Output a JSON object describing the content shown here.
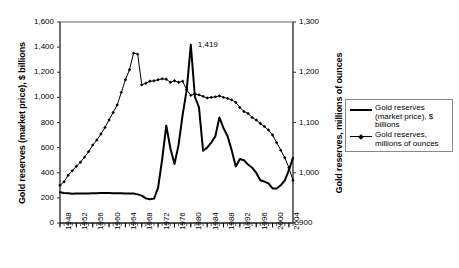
{
  "chart_data": {
    "type": "line",
    "title": "",
    "subtitle": "",
    "xlabel": "",
    "ylabel": "Gold reserves (market price), $ billions",
    "ylabel_secondary": "Gold reserves, millions of ounces",
    "grid": false,
    "legend_position": "right",
    "xlim": [
      1948,
      2005
    ],
    "ylim": [
      0,
      1600
    ],
    "ylim_secondary": [
      900,
      1300
    ],
    "yticks": [
      "0",
      "200",
      "400",
      "600",
      "800",
      "1,000",
      "1,200",
      "1,400",
      "1,600"
    ],
    "ytick_values": [
      0,
      200,
      400,
      600,
      800,
      1000,
      1200,
      1400,
      1600
    ],
    "yticks_secondary": [
      "900",
      "1,000",
      "1,100",
      "1,200",
      "1,300"
    ],
    "ytick_values_secondary": [
      900,
      1000,
      1100,
      1200,
      1300
    ],
    "xticks": [
      "1948",
      "1952",
      "1956",
      "1960",
      "1964",
      "1968",
      "1972",
      "1976",
      "1980",
      "1984",
      "1988",
      "1992",
      "1996",
      "2000",
      "2004"
    ],
    "xtick_values": [
      1948,
      1952,
      1956,
      1960,
      1964,
      1968,
      1972,
      1976,
      1980,
      1984,
      1988,
      1992,
      1996,
      2000,
      2004
    ],
    "annotations": [
      {
        "text": "1,419",
        "x": 1980,
        "y": 1419,
        "axis": "left"
      }
    ],
    "x": [
      1948,
      1949,
      1950,
      1951,
      1952,
      1953,
      1954,
      1955,
      1956,
      1957,
      1958,
      1959,
      1960,
      1961,
      1962,
      1963,
      1964,
      1965,
      1966,
      1967,
      1968,
      1969,
      1970,
      1971,
      1972,
      1973,
      1974,
      1975,
      1976,
      1977,
      1978,
      1979,
      1980,
      1981,
      1982,
      1983,
      1984,
      1985,
      1986,
      1987,
      1988,
      1989,
      1990,
      1991,
      1992,
      1993,
      1994,
      1995,
      1996,
      1997,
      1998,
      1999,
      2000,
      2001,
      2002,
      2003,
      2004,
      2005
    ],
    "series": [
      {
        "name": "Gold reserves (market price), $ billions",
        "axis": "left",
        "unit": "$ billions",
        "marker": "none",
        "linewidth": 2,
        "color": "#000000",
        "values": [
          245,
          238,
          236,
          233,
          234,
          234,
          235,
          235,
          236,
          237,
          238,
          238,
          238,
          237,
          236,
          236,
          235,
          235,
          235,
          228,
          218,
          196,
          189,
          194,
          282,
          508,
          775,
          595,
          470,
          620,
          860,
          1060,
          1419,
          1005,
          920,
          575,
          600,
          640,
          690,
          840,
          755,
          690,
          580,
          450,
          510,
          500,
          465,
          440,
          400,
          340,
          330,
          315,
          275,
          275,
          300,
          340,
          420,
          520
        ]
      },
      {
        "name": "Gold reserves, millions of ounces",
        "axis": "right",
        "unit": "millions of ounces",
        "marker": "diamond",
        "linewidth": 1,
        "color": "#000000",
        "values": [
          975,
          982,
          995,
          1004,
          1013,
          1021,
          1031,
          1042,
          1055,
          1065,
          1077,
          1090,
          1105,
          1120,
          1135,
          1160,
          1185,
          1205,
          1238,
          1236,
          1175,
          1178,
          1182,
          1183,
          1185,
          1187,
          1186,
          1180,
          1183,
          1180,
          1182,
          1165,
          1154,
          1157,
          1155,
          1152,
          1149,
          1150,
          1151,
          1153,
          1150,
          1148,
          1145,
          1140,
          1130,
          1122,
          1118,
          1110,
          1105,
          1098,
          1092,
          1085,
          1075,
          1060,
          1045,
          1030,
          1010,
          985
        ]
      }
    ]
  },
  "legend": {
    "items": [
      {
        "label": "Gold reserves\n(market price), $\nbillions",
        "style": "thick-line"
      },
      {
        "label": "Gold reserves,\nmillions of ounces",
        "style": "line-with-marker"
      }
    ]
  }
}
